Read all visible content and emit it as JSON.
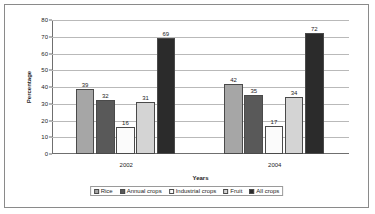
{
  "chart_data": {
    "type": "bar",
    "title": "",
    "xlabel": "Years",
    "ylabel": "Percentage",
    "categories": [
      "2002",
      "2004"
    ],
    "ylim": [
      0,
      80
    ],
    "yticks": [
      0,
      10,
      20,
      30,
      40,
      50,
      60,
      70,
      80
    ],
    "grid": true,
    "legend_position": "bottom",
    "series": [
      {
        "name": "Rice",
        "values": [
          39,
          42
        ],
        "color": "#a6a6a6"
      },
      {
        "name": "Annual crops",
        "values": [
          32,
          35
        ],
        "color": "#595959"
      },
      {
        "name": "Industrial crops",
        "values": [
          16,
          17
        ],
        "color": "#fbfbfb"
      },
      {
        "name": "Fruit",
        "values": [
          31,
          34
        ],
        "color": "#d4d4d4"
      },
      {
        "name": "All crops",
        "values": [
          69,
          72
        ],
        "color": "#2b2b2b"
      }
    ]
  },
  "axis": {
    "y_tick_labels": [
      "0",
      "10",
      "20",
      "30",
      "40",
      "50",
      "60",
      "70",
      "80"
    ],
    "x_tick_labels": [
      "2002",
      "2004"
    ],
    "y_title": "Percentage",
    "x_title": "Years"
  },
  "data_labels": {
    "2002": [
      "39",
      "32",
      "16",
      "31",
      "69"
    ],
    "2004": [
      "42",
      "35",
      "17",
      "34",
      "72"
    ]
  },
  "legend": {
    "items": [
      {
        "label": "Rice"
      },
      {
        "label": "Annual crops"
      },
      {
        "label": "Industrial crops"
      },
      {
        "label": "Fruit"
      },
      {
        "label": "All crops"
      }
    ]
  },
  "colors": {
    "frame_border": "#8a8a8a",
    "grid": "#b9b9b9",
    "axis": "#6f6f6f",
    "text": "#1c1c1c",
    "background": "#ffffff"
  }
}
